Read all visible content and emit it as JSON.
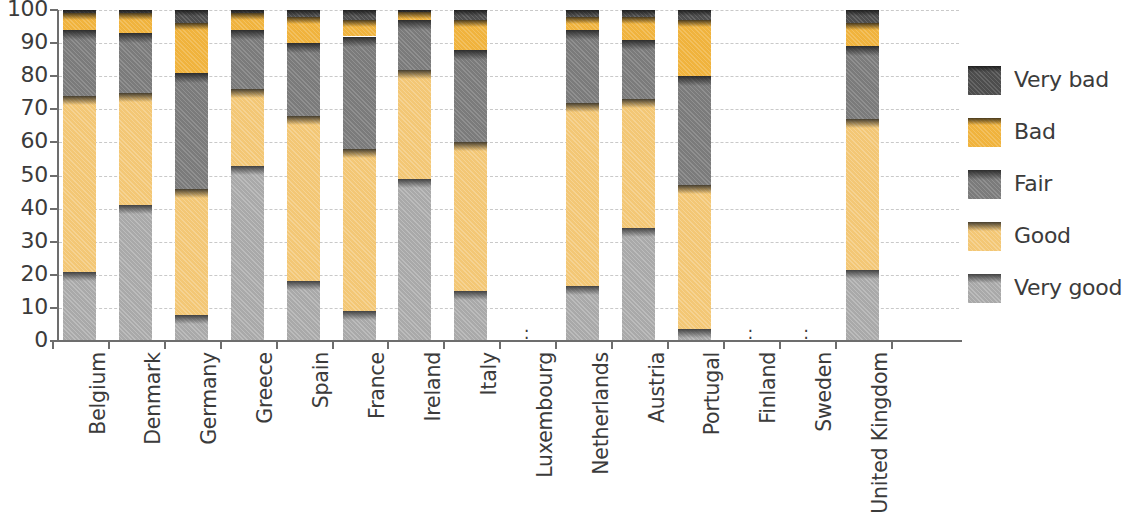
{
  "chart_data": {
    "type": "bar",
    "subtype": "stacked-bar-100-percent",
    "title": "",
    "subtitle": "",
    "xlabel": "",
    "ylabel": "",
    "ylim": [
      0,
      100
    ],
    "y_ticks": [
      0,
      10,
      20,
      30,
      40,
      50,
      60,
      70,
      80,
      90,
      100
    ],
    "grid": true,
    "grid_style": "dashed horizontal",
    "legend_position": "right",
    "no_data_symbol": ":",
    "categories": [
      "Belgium",
      "Denmark",
      "Germany",
      "Greece",
      "Spain",
      "France",
      "Ireland",
      "Italy",
      "Luxembourg",
      "Netherlands",
      "Austria",
      "Portugal",
      "Finland",
      "Sweden",
      "United Kingdom"
    ],
    "series": [
      {
        "name": "Very good",
        "color": "#a9a9a9",
        "values": [
          21,
          41,
          8,
          53,
          18,
          9,
          49,
          15,
          null,
          16.5,
          34,
          3.5,
          null,
          null,
          21.5
        ]
      },
      {
        "name": "Good",
        "color": "#f3c775",
        "values": [
          53,
          34,
          38,
          23,
          50,
          49,
          33,
          45,
          null,
          55.5,
          39,
          43.5,
          null,
          null,
          45.5
        ]
      },
      {
        "name": "Fair",
        "color": "#7b7b7b",
        "values": [
          20,
          18,
          35,
          18,
          22,
          34,
          15,
          28,
          null,
          22,
          18,
          33,
          null,
          null,
          22
        ]
      },
      {
        "name": "Bad",
        "color": "#f0b33d",
        "values": [
          5,
          6,
          15,
          5,
          8,
          5,
          2.5,
          9,
          null,
          4,
          7,
          17,
          null,
          null,
          7
        ]
      },
      {
        "name": "Very bad",
        "color": "#4d4d4d",
        "values": [
          1,
          1,
          4,
          1,
          2,
          3,
          0.5,
          3,
          null,
          2,
          2,
          3,
          null,
          null,
          4
        ]
      }
    ]
  },
  "legend": {
    "items": [
      {
        "label": "Very bad",
        "color": "#4d4d4d"
      },
      {
        "label": "Bad",
        "color": "#f0b33d"
      },
      {
        "label": "Fair",
        "color": "#7b7b7b"
      },
      {
        "label": "Good",
        "color": "#f3c775"
      },
      {
        "label": "Very good",
        "color": "#a9a9a9"
      }
    ]
  }
}
